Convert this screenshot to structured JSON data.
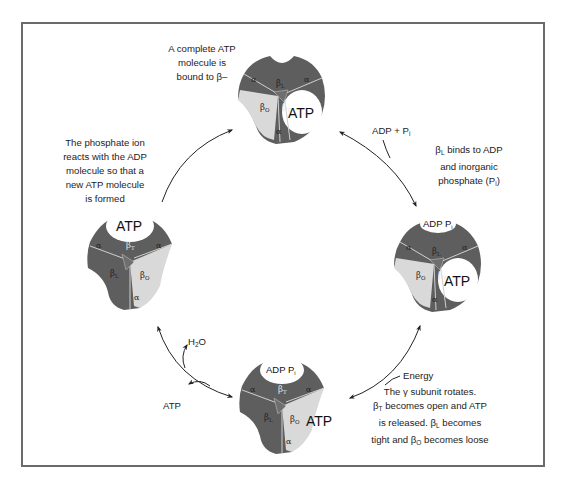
{
  "figure": {
    "colors": {
      "frame": "#6a6a6a",
      "subunit_dark": "#5e5e5e",
      "subunit_light": "#d9d9d9",
      "site_white": "#ffffff",
      "arrow": "#222222"
    }
  },
  "captions": {
    "top": {
      "line1": "A complete ATP",
      "line2": "molecule is",
      "line3": "bound to β–"
    },
    "right": {
      "line1_prefix": "β",
      "line1_sub": "L",
      "line1_rest": " binds to ADP",
      "line2": "and inorganic",
      "line3_prefix": "phosphate (P",
      "line3_sub": "i",
      "line3_rest": ")"
    },
    "left": {
      "line1": "The phosphate ion",
      "line2": "reacts with the ADP",
      "line3": "molecule so that a",
      "line4": "new ATP molecule",
      "line5": "is formed"
    },
    "bottom_right": {
      "line1": "The γ subunit rotates.",
      "line2_prefix": "β",
      "line2_sub": "T",
      "line2_rest": " becomes open and ATP",
      "line3_prefix": "is released.  β",
      "line3_sub": "L",
      "line3_rest": " becomes",
      "line4_prefix": "tight and β",
      "line4_sub": "O",
      "line4_rest": " becomes loose"
    }
  },
  "arrow_labels": {
    "adp_pi": {
      "prefix": "ADP + P",
      "sub": "i"
    },
    "energy": "Energy",
    "h2o": {
      "prefix": "H",
      "sub": "2",
      "rest": "O"
    },
    "atp_out": "ATP"
  },
  "states": [
    {
      "id": "top",
      "site_label": "ATP",
      "labels": {
        "alpha": "α",
        "beta_L": "β",
        "beta_L_sub": "L",
        "beta_O": "β",
        "beta_O_sub": "O",
        "beta_T": "β",
        "beta_T_sub": "T"
      }
    },
    {
      "id": "right",
      "site_label": "ATP",
      "open_label": {
        "prefix": "ADP P",
        "sub": "i"
      },
      "labels": {
        "alpha": "α",
        "beta_L": "β",
        "beta_L_sub": "L",
        "beta_O": "β",
        "beta_O_sub": "O",
        "beta_T": "β",
        "beta_T_sub": "T"
      }
    },
    {
      "id": "bottom",
      "site_label": "ATP",
      "open_label": {
        "prefix": "ADP P",
        "sub": "i"
      },
      "labels": {
        "alpha": "α",
        "beta_L": "β",
        "beta_L_sub": "L",
        "beta_O": "β",
        "beta_O_sub": "O",
        "beta_T": "β",
        "beta_T_sub": "T"
      }
    },
    {
      "id": "left",
      "site_label": "ATP",
      "labels": {
        "alpha": "α",
        "beta_L": "β",
        "beta_L_sub": "L",
        "beta_O": "β",
        "beta_O_sub": "O",
        "beta_T": "β",
        "beta_T_sub": "T"
      }
    }
  ]
}
